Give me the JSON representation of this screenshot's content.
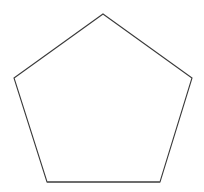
{
  "canvas": {
    "width": 204,
    "height": 192,
    "background_color": "#ffffff",
    "description": "White canvas containing a single line-drawn regular pentagon"
  },
  "shape": {
    "name": "pentagon",
    "sides": 5,
    "type": "regular-polygon-outline",
    "fill_color": "#ffffff",
    "stroke_color": "#3a3a3a",
    "stroke_width": 1.1,
    "base_edge_stroke_color": "#5d5d5d",
    "base_edge_stroke_width": 1.7,
    "orientation": "apex-up",
    "center": {
      "x": 103,
      "y": 100
    },
    "vertices": [
      {
        "label": "apex",
        "x": 103,
        "y": 14
      },
      {
        "label": "upper-right",
        "x": 192,
        "y": 78
      },
      {
        "label": "lower-right",
        "x": 160,
        "y": 182
      },
      {
        "label": "lower-left",
        "x": 47,
        "y": 182
      },
      {
        "label": "upper-left",
        "x": 14,
        "y": 78
      }
    ],
    "points_attr": "103,14 192,78 160,182 47,182 14,78",
    "base_edge_points": {
      "x1": 47,
      "y1": 182,
      "x2": 160,
      "y2": 182
    }
  }
}
